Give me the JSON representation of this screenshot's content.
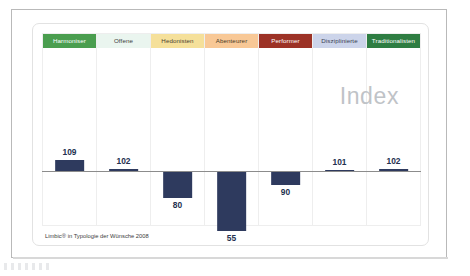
{
  "slide": {
    "watermark": "Index",
    "footer": "Limbic® in Typologie der Wünsche 2008"
  },
  "chart_data": {
    "type": "bar",
    "title": "Index",
    "xlabel": "",
    "ylabel": "Index",
    "baseline": 100,
    "ylim": [
      40,
      130
    ],
    "grid": false,
    "legend": "none",
    "bar_color": "#2e3a5e",
    "baseline_color": "#8c8c8c",
    "categories": [
      "Harmoniser",
      "Offene",
      "Hedonisten",
      "Abenteurer",
      "Performer",
      "Disziplinierte",
      "Traditionalisten"
    ],
    "values": [
      109,
      102,
      80,
      55,
      90,
      101,
      102
    ],
    "value_labels": [
      "109",
      "102",
      "80",
      "55",
      "90",
      "101",
      "102"
    ],
    "category_colors": [
      "#4a9e4f",
      "#eaf5ef",
      "#f5e09a",
      "#f8c896",
      "#9c3226",
      "#ccd4ea",
      "#2e7d42"
    ],
    "category_text_colors": [
      "#ffffff",
      "#3a3a3a",
      "#4a4233",
      "#4a3a28",
      "#ffffff",
      "#3a3f52",
      "#ffffff"
    ],
    "annotations": [
      "Index"
    ],
    "source_note": "Limbic® in Typologie der Wünsche 2008"
  }
}
